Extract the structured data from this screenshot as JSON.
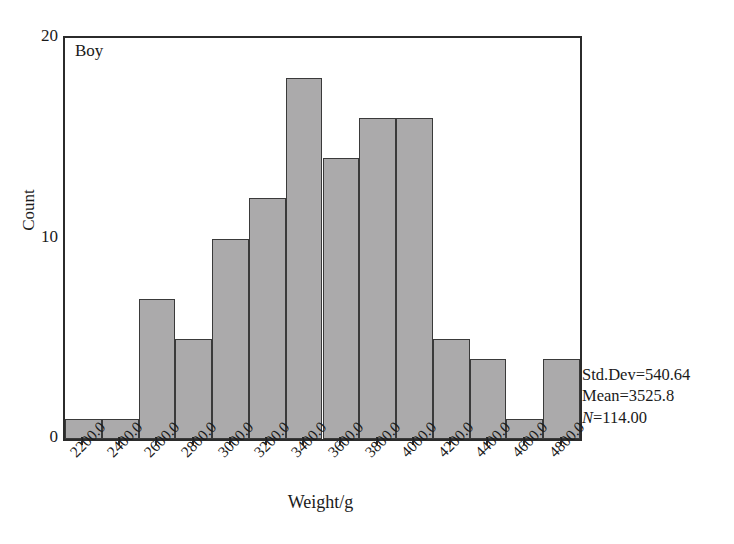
{
  "chart_data": {
    "type": "bar",
    "title": "",
    "series_label": "Boy",
    "xlabel": "Weight/g",
    "ylabel": "Count",
    "categories": [
      "2200.0",
      "2400.0",
      "2600.0",
      "2800.0",
      "3000.0",
      "3200.0",
      "3400.0",
      "3600.0",
      "3800.0",
      "4000.0",
      "4200.0",
      "4400.0",
      "4600.0",
      "4800.0"
    ],
    "values": [
      1,
      1,
      7,
      5,
      10,
      12,
      18,
      14,
      16,
      16,
      5,
      4,
      1,
      4
    ],
    "ylim": [
      0,
      20
    ],
    "y_ticks": [
      0,
      10,
      20
    ],
    "y_tick_labels": [
      "0",
      "10",
      "20"
    ],
    "xlim": [
      2100,
      4900
    ],
    "bin_width": 200,
    "grid": false,
    "legend": false,
    "bar_fill_color": "#abaaab",
    "bar_edge_color": "#3a3a3a",
    "axis_color": "#2b2b2b",
    "background_color": "#ffffff"
  },
  "annotation": {
    "std_dev_label": "Std.Dev=540.64",
    "mean_label": "Mean=3525.8",
    "n_symbol": "N",
    "n_value": "=114.00"
  }
}
